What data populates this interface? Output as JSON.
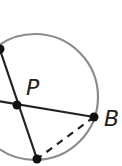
{
  "diagram": {
    "type": "circle-geometry",
    "circle": {
      "cx": 35,
      "cy": 97,
      "r": 63,
      "stroke": "#8c8c8c"
    },
    "points": [
      {
        "id": "top-left",
        "x": 0,
        "y": 49,
        "label": ""
      },
      {
        "id": "P",
        "x": 17,
        "y": 105,
        "label": "P"
      },
      {
        "id": "B",
        "x": 94,
        "y": 117,
        "label": "B"
      },
      {
        "id": "bottom",
        "x": 37,
        "y": 159,
        "label": ""
      }
    ],
    "labels": {
      "p": "P",
      "b": "B"
    },
    "segments": [
      {
        "from": "top-left",
        "to": "bottom",
        "style": "solid"
      },
      {
        "from": "left-edge",
        "to": "B",
        "style": "solid"
      },
      {
        "from": "B",
        "to": "bottom",
        "style": "dashed"
      }
    ],
    "colors": {
      "line": "#222222",
      "circle": "#8c8c8c",
      "point": "#111111"
    }
  }
}
